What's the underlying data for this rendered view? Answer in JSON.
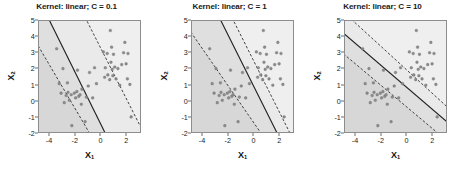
{
  "figure": {
    "width": 459,
    "height": 169,
    "background": "#ffffff",
    "panel_count": 3
  },
  "axes": {
    "xlabel": "X",
    "xlabel_sub": "1",
    "ylabel": "X",
    "ylabel_sub": "2",
    "xticks": [
      -4,
      -2,
      0,
      2
    ],
    "yticks": [
      5,
      4,
      3,
      2,
      1,
      0,
      -1,
      -2
    ],
    "xlim": [
      -4.85,
      3.15
    ],
    "ylim": [
      -2,
      5
    ],
    "xtick_labels": [
      "-4",
      "-2",
      "0",
      "2"
    ],
    "ytick_labels": [
      "5",
      "4",
      "3",
      "2",
      "1",
      "0",
      "-1",
      "-2"
    ]
  },
  "style": {
    "region_negative_color": "#d7d7d7",
    "region_positive_color": "#efefef",
    "margin_band_color": "#e5e5e5",
    "point_color": "#8c8c8c",
    "point_edge_color": "#6b6b6b",
    "boundary_color": "#1f1f1f",
    "margin_line_color": "#1f1f1f",
    "frame_color": "#8d8d8d",
    "text_color": "#1a1a1a"
  },
  "chart_data": {
    "type": "scatter",
    "xlabel": "X1",
    "ylabel": "X2",
    "xlim": [
      -4.85,
      3.15
    ],
    "ylim": [
      -2,
      5
    ],
    "grid": false,
    "legend": null,
    "panels": [
      {
        "title": "Kernel: linear; C = 0.1",
        "kernel": "linear",
        "C": 0.1,
        "boundary": {
          "x1": -4.0,
          "y1": 5.0,
          "x2": 0.35,
          "y2": -2.0
        },
        "margin_upper": {
          "x1": -1.05,
          "y1": 5.0,
          "x2": 3.15,
          "y2": -1.6
        },
        "margin_lower": {
          "x1": -4.85,
          "y1": 3.35,
          "x2": -0.9,
          "y2": -2.0
        },
        "margin_width": "wide"
      },
      {
        "title": "Kernel: linear; C = 1",
        "kernel": "linear",
        "C": 1,
        "boundary": {
          "x1": -2.55,
          "y1": 5.0,
          "x2": 1.85,
          "y2": -2.0
        },
        "margin_upper": {
          "x1": -1.55,
          "y1": 5.0,
          "x2": 3.15,
          "y2": -2.45
        },
        "margin_lower": {
          "x1": -4.85,
          "y1": 4.2,
          "x2": 0.55,
          "y2": -2.0
        },
        "margin_width": "medium"
      },
      {
        "title": "Kernel: linear; C = 10",
        "kernel": "linear",
        "C": 10,
        "boundary": {
          "x1": -4.85,
          "y1": 4.15,
          "x2": 3.15,
          "y2": -1.3
        },
        "margin_upper": {
          "x1": -4.2,
          "y1": 5.0,
          "x2": 3.15,
          "y2": -0.35
        },
        "margin_lower": {
          "x1": -4.85,
          "y1": 2.85,
          "x2": 2.4,
          "y2": -2.0
        },
        "margin_width": "narrow"
      }
    ],
    "points": [
      {
        "x": -3.45,
        "y": 3.25
      },
      {
        "x": -3.25,
        "y": 1.05
      },
      {
        "x": -3.1,
        "y": 0.45
      },
      {
        "x": -2.95,
        "y": 2.0
      },
      {
        "x": -2.85,
        "y": -0.15
      },
      {
        "x": -2.7,
        "y": 0.3
      },
      {
        "x": -2.6,
        "y": 1.1
      },
      {
        "x": -2.55,
        "y": 0.5
      },
      {
        "x": -2.45,
        "y": 0.0
      },
      {
        "x": -2.3,
        "y": 0.35
      },
      {
        "x": -2.25,
        "y": -1.6
      },
      {
        "x": -2.05,
        "y": 0.45
      },
      {
        "x": -1.95,
        "y": 0.15
      },
      {
        "x": -1.85,
        "y": 0.55
      },
      {
        "x": -1.8,
        "y": 1.9
      },
      {
        "x": -1.7,
        "y": 0.25
      },
      {
        "x": -1.6,
        "y": 0.35
      },
      {
        "x": -1.5,
        "y": -0.25
      },
      {
        "x": -1.45,
        "y": 0.7
      },
      {
        "x": -1.2,
        "y": -1.35
      },
      {
        "x": -1.1,
        "y": 0.2
      },
      {
        "x": -0.95,
        "y": 0.9
      },
      {
        "x": -0.85,
        "y": 1.75
      },
      {
        "x": -0.6,
        "y": 0.15
      },
      {
        "x": -0.45,
        "y": 2.05
      },
      {
        "x": -0.3,
        "y": 1.05
      },
      {
        "x": 0.25,
        "y": 3.05
      },
      {
        "x": 0.35,
        "y": 1.45
      },
      {
        "x": 0.4,
        "y": 2.05
      },
      {
        "x": 0.55,
        "y": 2.95
      },
      {
        "x": 0.6,
        "y": 1.6
      },
      {
        "x": 0.75,
        "y": 1.3
      },
      {
        "x": 0.8,
        "y": 4.4
      },
      {
        "x": 0.85,
        "y": 2.4
      },
      {
        "x": 0.9,
        "y": 3.35
      },
      {
        "x": 0.95,
        "y": 1.95
      },
      {
        "x": 1.0,
        "y": 1.55
      },
      {
        "x": 1.05,
        "y": 2.9
      },
      {
        "x": 1.15,
        "y": 2.1
      },
      {
        "x": 1.25,
        "y": 1.35
      },
      {
        "x": 1.4,
        "y": 2.0
      },
      {
        "x": 1.55,
        "y": 0.95
      },
      {
        "x": 1.7,
        "y": 2.25
      },
      {
        "x": 1.85,
        "y": 3.0
      },
      {
        "x": 1.95,
        "y": 3.65
      },
      {
        "x": 2.05,
        "y": 2.3
      },
      {
        "x": 2.15,
        "y": 1.35
      },
      {
        "x": 2.2,
        "y": 2.95
      },
      {
        "x": 2.35,
        "y": 1.0
      },
      {
        "x": 2.45,
        "y": -1.05
      }
    ]
  }
}
